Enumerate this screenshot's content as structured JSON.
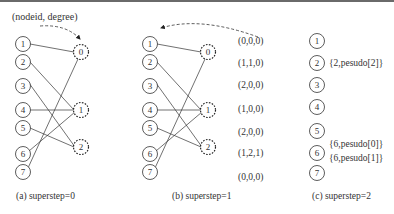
{
  "header_label": "(nodeid, degree)",
  "panels": [
    {
      "id": "a",
      "caption": "(a)  superstep=0",
      "source_nodes": [
        "1",
        "2",
        "3",
        "4",
        "5",
        "6",
        "7"
      ],
      "target_nodes": [
        "0",
        "1",
        "2"
      ],
      "edges": [
        [
          "1",
          "0"
        ],
        [
          "2",
          "1"
        ],
        [
          "3",
          "2"
        ],
        [
          "4",
          "1"
        ],
        [
          "5",
          "2"
        ],
        [
          "6",
          "1"
        ],
        [
          "7",
          "0"
        ]
      ]
    },
    {
      "id": "b",
      "caption": "(b)  superstep=1",
      "source_nodes": [
        "1",
        "2",
        "3",
        "4",
        "5",
        "6",
        "7"
      ],
      "target_nodes": [
        "0",
        "1",
        "2"
      ],
      "edges": [
        [
          "1",
          "0"
        ],
        [
          "2",
          "1"
        ],
        [
          "3",
          "2"
        ],
        [
          "4",
          "1"
        ],
        [
          "5",
          "2"
        ],
        [
          "6",
          "1"
        ],
        [
          "7",
          "0"
        ]
      ],
      "tuples": [
        "(0,0,0)",
        "(1,1,0)",
        "(2,0,0)",
        "(1,0,0)",
        "(2,0,0)",
        "(1,2,1)",
        "(0,0,0)"
      ]
    },
    {
      "id": "c",
      "caption": "(c)  superstep=2",
      "nodes": [
        "1",
        "2",
        "3",
        "4",
        "5",
        "6",
        "7"
      ],
      "annotations": {
        "node2": "{2,pesudo[2]}",
        "node6a": "{6,pesudo[0]}",
        "node6b": "{6,pesudo[1]}"
      }
    }
  ],
  "colors": {
    "stroke": "#333333",
    "topbar": "#6a6a6a",
    "background": "#ffffff"
  }
}
